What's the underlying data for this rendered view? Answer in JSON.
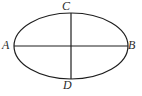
{
  "figure": {
    "kind": "ellipse-axes-diagram",
    "canvas": {
      "width": 142,
      "height": 96,
      "background": "#ffffff"
    },
    "stroke_color": "#1e1e1e",
    "label_color": "#2b2b2b",
    "ellipse": {
      "center_x": 71,
      "center_y": 46,
      "radius_x": 57,
      "radius_y": 33,
      "stroke_width": 1.2
    },
    "axes": [
      {
        "name": "major-axis",
        "orientation": "horizontal",
        "x1": 14,
        "y1": 46,
        "x2": 128,
        "y2": 46,
        "endpoint_labels": [
          "A",
          "B"
        ]
      },
      {
        "name": "minor-axis",
        "orientation": "vertical",
        "x1": 71,
        "y1": 13,
        "x2": 71,
        "y2": 79,
        "endpoint_labels": [
          "C",
          "D"
        ]
      }
    ],
    "labels": {
      "top": "C",
      "left": "A",
      "right": "B",
      "bottom": "D"
    }
  }
}
